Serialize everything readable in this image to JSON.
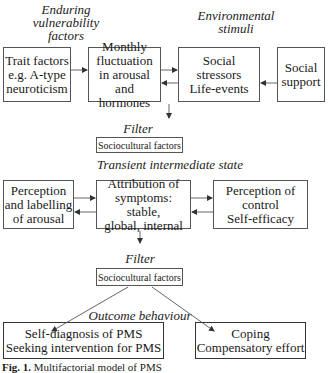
{
  "top_labels": {
    "enduring": [
      "Enduring",
      "vulnerability",
      "factors"
    ],
    "environmental": [
      "Environmental",
      "stimuli"
    ]
  },
  "row1": {
    "trait": [
      "Trait factors",
      "e.g. A-type",
      "neuroticism"
    ],
    "monthly": [
      "Monthly",
      "fluctuation",
      "in arousal",
      "and hormones"
    ],
    "social_stressors": [
      "Social stressors",
      "Life-events"
    ],
    "social_support": [
      "Social",
      "support"
    ]
  },
  "filter1": {
    "label": "Filter",
    "box": "Sociocultural factors"
  },
  "transient_label": "Transient intermediate state",
  "row2": {
    "perception_arousal": [
      "Perception",
      "and labelling",
      "of arousal"
    ],
    "attribution": [
      "Attribution of",
      "symptoms: stable,",
      "global, internal"
    ],
    "perception_control": [
      "Perception of",
      "control",
      "Self-efficacy"
    ]
  },
  "filter2": {
    "label": "Filter",
    "box": "Sociocultural factors"
  },
  "outcome_label": "Outcome behaviour",
  "outcomes": {
    "self_diagnosis": [
      "Self-diagnosis of PMS",
      "Seeking intervention for PMS"
    ],
    "coping": [
      "Coping",
      "Compensatory effort"
    ]
  },
  "caption": {
    "prefix": "Fig. 1.",
    "text": "Multifactorial model of PMS"
  },
  "colors": {
    "line": "#555555",
    "text": "#1a1a1a"
  }
}
